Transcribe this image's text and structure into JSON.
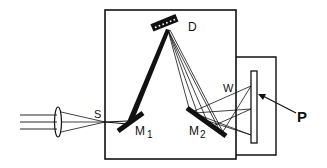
{
  "diagram": {
    "type": "spectrograph-schematic",
    "colors": {
      "ink": "#111111",
      "background": "#ffffff"
    },
    "labels": {
      "grating": "D",
      "slit": "S",
      "mirror1": "M",
      "mirror1_sub": "1",
      "mirror2": "M",
      "mirror2_sub": "2",
      "window": "W",
      "plate": "P"
    },
    "components": [
      {
        "id": "lens",
        "name": "Lens"
      },
      {
        "id": "slit",
        "name": "Entrance slit",
        "label": "S"
      },
      {
        "id": "m1",
        "name": "Collimating mirror",
        "label": "M1"
      },
      {
        "id": "grating",
        "name": "Diffraction grating",
        "label": "D"
      },
      {
        "id": "m2",
        "name": "Focusing mirror",
        "label": "M2"
      },
      {
        "id": "window",
        "name": "Window",
        "label": "W"
      },
      {
        "id": "plate",
        "name": "Photographic plate",
        "label": "P"
      }
    ]
  }
}
